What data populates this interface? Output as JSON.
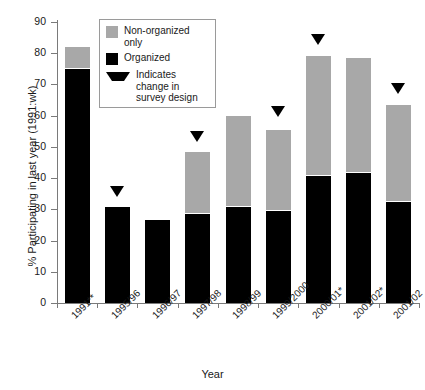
{
  "chart_data": {
    "type": "bar",
    "stacked": true,
    "title": "",
    "xlabel": "Year",
    "ylabel": "% Participating in last year (1991:wk)",
    "ylim": [
      0,
      90
    ],
    "yticks": [
      0,
      10,
      20,
      30,
      40,
      50,
      60,
      70,
      80,
      90
    ],
    "grid": false,
    "legend_position": "upper-left-inside",
    "categories": [
      "1991**",
      "1995/96",
      "1996/97",
      "1997/98",
      "1998/99",
      "1999/2000",
      "2000/01*",
      "2001/02*",
      "2001/02"
    ],
    "series": [
      {
        "name": "Organized",
        "color": "#000000",
        "values": [
          75.0,
          30.8,
          26.5,
          28.5,
          30.8,
          29.5,
          40.8,
          41.8,
          32.2
        ]
      },
      {
        "name": "Non-organized only",
        "color": "#a8a8a8",
        "values": [
          7.0,
          0.0,
          0.0,
          19.8,
          29.2,
          25.8,
          38.2,
          36.8,
          31.1
        ]
      }
    ],
    "totals": [
      82.0,
      30.8,
      26.5,
      48.3,
      60.0,
      55.3,
      79.0,
      78.6,
      63.3
    ],
    "annotations": {
      "marker_symbol": "▼",
      "marker_label": "Indicates change in survey design",
      "marker_categories": [
        "1995/96",
        "1997/98",
        "1999/2000",
        "2000/01*",
        "2001/02"
      ],
      "marker_values": [
        34.0,
        51.5,
        59.5,
        82.5,
        67.0
      ]
    }
  },
  "legend": {
    "items": [
      {
        "label": "Non-organized only",
        "swatch": "gray-square-swatch"
      },
      {
        "label": "Organized",
        "swatch": "black-square-swatch"
      },
      {
        "label": "Indicates change in survey design",
        "swatch": "down-triangle-marker"
      }
    ]
  },
  "axes": {
    "x_title": "Year",
    "y_title": "% Participating in last year (1991:wk)",
    "y_tick_labels": [
      "0",
      "10",
      "20",
      "30",
      "40",
      "50",
      "60",
      "70",
      "80",
      "90"
    ],
    "x_tick_labels": [
      "1991**",
      "1995/96",
      "1996/97",
      "1997/98",
      "1998/99",
      "1999/2000",
      "2000/01*",
      "2001/02*",
      "2001/02"
    ]
  },
  "colors": {
    "organized": "#000000",
    "non_organized": "#a8a8a8",
    "axis": "#7a7a7a",
    "text": "#1a1a1a",
    "background": "#ffffff"
  }
}
